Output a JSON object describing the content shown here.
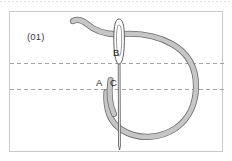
{
  "figure": {
    "id_label": "(01)",
    "type": "embroidery-stitch-diagram",
    "point_labels": {
      "a": "A",
      "b": "B",
      "c": "C"
    },
    "guide_lines": {
      "style": "dashed",
      "count": 2,
      "color": "#9a9a9a"
    },
    "colors": {
      "thread_fill": "#c6c6c6",
      "thread_outline": "#6b6b6b",
      "needle_fill": "#ffffff",
      "needle_outline": "#555555",
      "frame_border": "#c9c9c9",
      "background": "#ffffff",
      "label_text": "#1e1e1e",
      "id_text": "#3a3a3a"
    }
  }
}
